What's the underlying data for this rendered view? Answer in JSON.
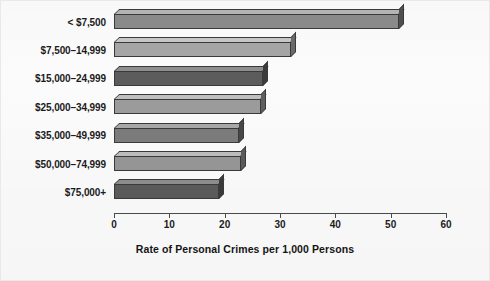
{
  "chart_data": {
    "type": "bar",
    "orientation": "horizontal",
    "title": "",
    "xlabel": "Rate of Personal Crimes per 1,000 Persons",
    "ylabel": "",
    "categories": [
      "< $7,500",
      "$7,500–14,999",
      "$15,000–24,999",
      "$25,000–34,999",
      "$35,000–49,999",
      "$50,000–74,999",
      "$75,000+"
    ],
    "values": [
      51.5,
      32.0,
      27.0,
      26.5,
      22.5,
      23.0,
      19.0
    ],
    "xlim": [
      0,
      60
    ],
    "xticks": [
      0,
      10,
      20,
      30,
      40,
      50,
      60
    ],
    "xtick_labels": [
      "0",
      "10",
      "20",
      "30",
      "40",
      "50",
      "60"
    ],
    "grid": false,
    "legend": "none",
    "bar_colors": [
      "#8a8a8a",
      "#a5a5a5",
      "#5c5c5c",
      "#9b9b9b",
      "#7b7b7b",
      "#959595",
      "#5a5a5a"
    ],
    "bar_top_colors": [
      "#b4b4b4",
      "#c6c6c6",
      "#8e8e8e",
      "#bfbfbf",
      "#a8a8a8",
      "#bcbcbc",
      "#8c8c8c"
    ],
    "bar_side_colors": [
      "#4f4f4f",
      "#6a6a6a",
      "#3b3b3b",
      "#5f5f5f",
      "#474747",
      "#5b5b5b",
      "#3a3a3a"
    ],
    "style": "3d-shaded-bars",
    "background_color": "#fbfbfb",
    "axis_color": "#4a4a4a",
    "text_color": "#1b1b1b"
  }
}
